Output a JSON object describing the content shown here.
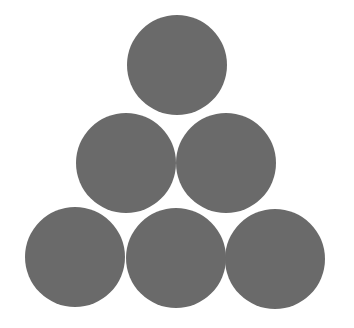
{
  "diagram": {
    "fill_color": "#6a6a6a",
    "background_color": "#ffffff",
    "radius": 50,
    "rows": [
      {
        "row": 1,
        "count": 1
      },
      {
        "row": 2,
        "count": 2
      },
      {
        "row": 3,
        "count": 3
      }
    ],
    "circles": [
      {
        "id": "top",
        "cx": 177,
        "cy": 65
      },
      {
        "id": "middle-left",
        "cx": 126,
        "cy": 163
      },
      {
        "id": "middle-right",
        "cx": 226,
        "cy": 163
      },
      {
        "id": "bottom-left",
        "cx": 75,
        "cy": 257
      },
      {
        "id": "bottom-center",
        "cx": 176,
        "cy": 258
      },
      {
        "id": "bottom-right",
        "cx": 275,
        "cy": 259
      }
    ]
  }
}
